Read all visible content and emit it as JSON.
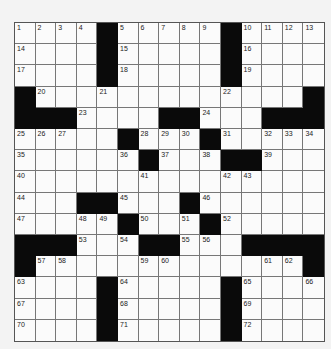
{
  "puzzle": {
    "rows": 15,
    "cols": 15,
    "pattern": [
      "....#.....#....",
      "....#.....#....",
      "....#.....#....",
      "#.............#",
      "###....##...###",
      ".....#...#.....",
      "......#...##...",
      "...............",
      "...##...#......",
      ".....#...#.....",
      "###...##...####",
      "#.............#",
      "....#.....#....",
      "....#.....#....",
      "....#.....#...."
    ],
    "numbers": [
      {
        "r": 0,
        "c": 0,
        "n": 1
      },
      {
        "r": 0,
        "c": 1,
        "n": 2
      },
      {
        "r": 0,
        "c": 2,
        "n": 3
      },
      {
        "r": 0,
        "c": 3,
        "n": 4
      },
      {
        "r": 0,
        "c": 5,
        "n": 5
      },
      {
        "r": 0,
        "c": 6,
        "n": 6
      },
      {
        "r": 0,
        "c": 7,
        "n": 7
      },
      {
        "r": 0,
        "c": 8,
        "n": 8
      },
      {
        "r": 0,
        "c": 9,
        "n": 9
      },
      {
        "r": 0,
        "c": 11,
        "n": 10
      },
      {
        "r": 0,
        "c": 12,
        "n": 11
      },
      {
        "r": 0,
        "c": 13,
        "n": 12
      },
      {
        "r": 0,
        "c": 14,
        "n": 13
      },
      {
        "r": 1,
        "c": 0,
        "n": 14
      },
      {
        "r": 1,
        "c": 5,
        "n": 15
      },
      {
        "r": 1,
        "c": 11,
        "n": 16
      },
      {
        "r": 2,
        "c": 0,
        "n": 17
      },
      {
        "r": 2,
        "c": 5,
        "n": 18
      },
      {
        "r": 2,
        "c": 11,
        "n": 19
      },
      {
        "r": 3,
        "c": 1,
        "n": 20
      },
      {
        "r": 3,
        "c": 4,
        "n": 21
      },
      {
        "r": 3,
        "c": 10,
        "n": 22
      },
      {
        "r": 4,
        "c": 3,
        "n": 23
      },
      {
        "r": 4,
        "c": 9,
        "n": 24
      },
      {
        "r": 5,
        "c": 0,
        "n": 25
      },
      {
        "r": 5,
        "c": 1,
        "n": 26
      },
      {
        "r": 5,
        "c": 2,
        "n": 27
      },
      {
        "r": 5,
        "c": 6,
        "n": 28
      },
      {
        "r": 5,
        "c": 7,
        "n": 29
      },
      {
        "r": 5,
        "c": 8,
        "n": 30
      },
      {
        "r": 5,
        "c": 10,
        "n": 31
      },
      {
        "r": 5,
        "c": 12,
        "n": 32
      },
      {
        "r": 5,
        "c": 13,
        "n": 33
      },
      {
        "r": 5,
        "c": 14,
        "n": 34
      },
      {
        "r": 6,
        "c": 0,
        "n": 35
      },
      {
        "r": 6,
        "c": 5,
        "n": 36
      },
      {
        "r": 6,
        "c": 7,
        "n": 37
      },
      {
        "r": 6,
        "c": 9,
        "n": 38
      },
      {
        "r": 6,
        "c": 12,
        "n": 39
      },
      {
        "r": 7,
        "c": 0,
        "n": 40
      },
      {
        "r": 7,
        "c": 6,
        "n": 41
      },
      {
        "r": 7,
        "c": 10,
        "n": 42
      },
      {
        "r": 7,
        "c": 11,
        "n": 43
      },
      {
        "r": 8,
        "c": 0,
        "n": 44
      },
      {
        "r": 8,
        "c": 5,
        "n": 45
      },
      {
        "r": 8,
        "c": 9,
        "n": 46
      },
      {
        "r": 9,
        "c": 0,
        "n": 47
      },
      {
        "r": 9,
        "c": 3,
        "n": 48
      },
      {
        "r": 9,
        "c": 4,
        "n": 49
      },
      {
        "r": 9,
        "c": 6,
        "n": 50
      },
      {
        "r": 9,
        "c": 8,
        "n": 51
      },
      {
        "r": 9,
        "c": 10,
        "n": 52
      },
      {
        "r": 10,
        "c": 3,
        "n": 53
      },
      {
        "r": 10,
        "c": 5,
        "n": 54
      },
      {
        "r": 10,
        "c": 8,
        "n": 55
      },
      {
        "r": 10,
        "c": 9,
        "n": 56
      },
      {
        "r": 11,
        "c": 1,
        "n": 57
      },
      {
        "r": 11,
        "c": 2,
        "n": 58
      },
      {
        "r": 11,
        "c": 6,
        "n": 59
      },
      {
        "r": 11,
        "c": 7,
        "n": 60
      },
      {
        "r": 11,
        "c": 12,
        "n": 61
      },
      {
        "r": 11,
        "c": 13,
        "n": 62
      },
      {
        "r": 12,
        "c": 0,
        "n": 63
      },
      {
        "r": 12,
        "c": 5,
        "n": 64
      },
      {
        "r": 12,
        "c": 11,
        "n": 65
      },
      {
        "r": 12,
        "c": 14,
        "n": 66
      },
      {
        "r": 13,
        "c": 0,
        "n": 67
      },
      {
        "r": 13,
        "c": 5,
        "n": 68
      },
      {
        "r": 13,
        "c": 11,
        "n": 69
      },
      {
        "r": 14,
        "c": 0,
        "n": 70
      },
      {
        "r": 14,
        "c": 5,
        "n": 71
      },
      {
        "r": 14,
        "c": 11,
        "n": 72
      }
    ]
  },
  "colors": {
    "background": "#f3f3f3",
    "cell": "#fbfbfb",
    "block": "#0a0a0a",
    "gridline": "#777777"
  }
}
